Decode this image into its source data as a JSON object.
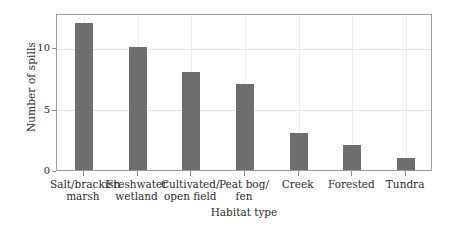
{
  "chart_data": {
    "type": "bar",
    "title": "",
    "subtitle": "",
    "xlabel": "Habitat type",
    "ylabel": "Number of spills",
    "categories": [
      "Salt/brackish marsh",
      "Freshwater wetland",
      "Cultivated/ open field",
      "Peat bog/ fen",
      "Creek",
      "Forested",
      "Tundra"
    ],
    "category_lines": [
      [
        "Salt/brackish",
        "marsh"
      ],
      [
        "Freshwater",
        "wetland"
      ],
      [
        "Cultivated/",
        "open field"
      ],
      [
        "Peat bog/",
        "fen"
      ],
      [
        "Creek",
        ""
      ],
      [
        "Forested",
        ""
      ],
      [
        "Tundra",
        ""
      ]
    ],
    "values": [
      12,
      10,
      8,
      7,
      3,
      2,
      1
    ],
    "ylim": [
      0,
      12.8
    ],
    "yticks": [
      0,
      5,
      10
    ],
    "ytick_labels": [
      "0",
      "5",
      "10"
    ],
    "grid": "both",
    "legend": "none",
    "bar_color": "#6e6e6e",
    "grid_color": "#e2e2e2",
    "axis_color": "#9a9a9a",
    "background": "#ffffff"
  }
}
